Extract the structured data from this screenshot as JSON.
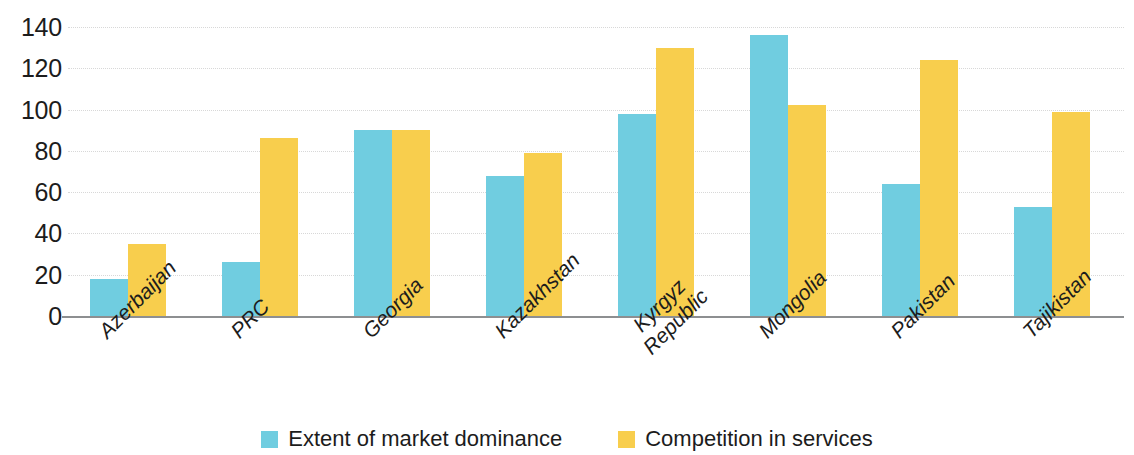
{
  "chart_data": {
    "type": "bar",
    "title": "",
    "subtitle": "",
    "xlabel": "",
    "ylabel": "",
    "ylim": [
      0,
      140
    ],
    "y_ticks": [
      0,
      20,
      40,
      60,
      80,
      100,
      120,
      140
    ],
    "grid": true,
    "legend_position": "bottom-center",
    "categories": [
      "Azerbaijan",
      "PRC",
      "Georgia",
      "Kazakhstan",
      "Kyrgyz Republic",
      "Mongolia",
      "Pakistan",
      "Tajikistan"
    ],
    "category_lines": [
      [
        "Azerbaijan"
      ],
      [
        "PRC"
      ],
      [
        "Georgia"
      ],
      [
        "Kazakhstan"
      ],
      [
        "Kyrgyz",
        "Republic"
      ],
      [
        "Mongolia"
      ],
      [
        "Pakistan"
      ],
      [
        "Tajikistan"
      ]
    ],
    "series": [
      {
        "name": "Extent of market dominance",
        "color": "#70cde0",
        "values": [
          18,
          26,
          90,
          68,
          98,
          136,
          64,
          53
        ]
      },
      {
        "name": "Competition in services",
        "color": "#f8ce4d",
        "values": [
          35,
          86,
          90,
          79,
          130,
          102,
          124,
          99
        ]
      }
    ]
  },
  "legend": {
    "items": [
      {
        "label": "Extent of market dominance",
        "color": "#70cde0"
      },
      {
        "label": "Competition in services",
        "color": "#f8ce4d"
      }
    ]
  },
  "colors": {
    "series_blue": "#70cde0",
    "series_yellow": "#f8ce4d",
    "axis": "#8d8f91",
    "gridline": "#d8d8d8",
    "text": "#1c1c1c",
    "background": "#ffffff"
  }
}
